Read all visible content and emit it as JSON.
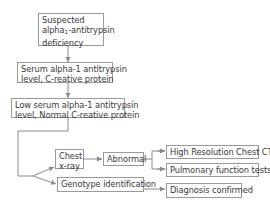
{
  "diagram": {
    "type": "flowchart",
    "nodes": {
      "suspected": {
        "line1": "Suspected",
        "line2_prefix": "alpha",
        "line2_sub": "1",
        "line2_suffix": "-antitrypsin",
        "line3": "deficiency"
      },
      "serum": {
        "line1": "Serum alpha-1 antitrypsin",
        "line2": "level, C-reative protein"
      },
      "low_serum": {
        "line1": "Low serum alpha-1 antitrypsin",
        "line2": "level, Normal C-reative protein"
      },
      "chest_xray": {
        "line1": "Chest",
        "line2": "x-ray"
      },
      "abnormal": {
        "label": "Abnormal"
      },
      "hrct": {
        "label": "High Resolution Chest CT"
      },
      "pft": {
        "label": "Pulmonary function tests"
      },
      "genotype": {
        "label": "Genotype identification"
      },
      "diagnosis": {
        "label": "Diagnosis confirmed"
      }
    },
    "edges": [
      [
        "suspected",
        "serum"
      ],
      [
        "serum",
        "low_serum"
      ],
      [
        "low_serum",
        "chest_xray"
      ],
      [
        "low_serum",
        "genotype"
      ],
      [
        "chest_xray",
        "abnormal"
      ],
      [
        "abnormal",
        "hrct"
      ],
      [
        "abnormal",
        "pft"
      ],
      [
        "genotype",
        "diagnosis"
      ]
    ],
    "colors": {
      "border": "#9a9a9a",
      "line": "#8a8a8a",
      "text": "#3a3a3a"
    }
  }
}
